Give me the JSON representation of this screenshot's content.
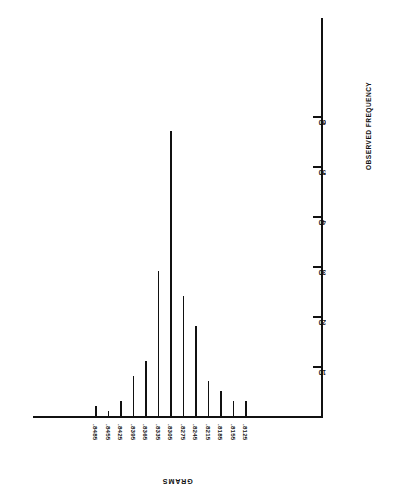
{
  "chart_data": {
    "type": "bar",
    "title": "",
    "subtitle": "",
    "orientation": "rotated-180",
    "xlabel": "GRAMS",
    "ylabel": "OBSERVED FREQUENCY",
    "categories": [
      ".8485",
      ".8455",
      ".8425",
      ".8395",
      ".8365",
      ".8335",
      ".8305",
      ".8275",
      ".8245",
      ".8215",
      ".8185",
      ".8155",
      ".8125"
    ],
    "values": [
      2,
      1,
      3,
      8,
      11,
      29,
      57,
      24,
      18,
      7,
      5,
      3,
      3
    ],
    "ylim": [
      0,
      63
    ],
    "ytick_values": [
      10,
      20,
      30,
      40,
      50,
      60
    ],
    "ytick_labels": [
      "10",
      "20",
      "30",
      "40",
      "50",
      "60"
    ],
    "grid": false,
    "legend": null
  },
  "axes": {
    "x_title": "GRAMS",
    "y_title": "OBSERVED FREQUENCY"
  }
}
